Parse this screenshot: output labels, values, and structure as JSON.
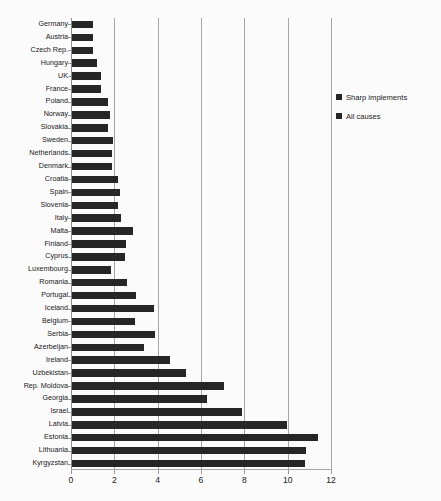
{
  "chart_data": {
    "type": "bar",
    "orientation": "horizontal",
    "title": "",
    "xlabel": "",
    "ylabel": "",
    "xlim": [
      0,
      12
    ],
    "xticks": [
      0,
      2,
      4,
      6,
      8,
      10,
      12
    ],
    "xtick_labels": [
      "0",
      "2",
      "4",
      "6",
      "8",
      "10",
      "12"
    ],
    "grid": true,
    "legend_position": "right",
    "bar_color": "#262626",
    "categories": [
      "Germany",
      "Austria",
      "Czech Rep.",
      "Hungary",
      "UK",
      "France",
      "Poland",
      "Norway",
      "Slovakia",
      "Sweden",
      "Netherlands",
      "Denmark",
      "Croatia",
      "Spain",
      "Slovenia",
      "Italy",
      "Malta",
      "Finland",
      "Cyprus",
      "Luxembourg",
      "Romania",
      "Portugal",
      "Iceland",
      "Belgium",
      "Serbia",
      "Azerbeijan",
      "Ireland",
      "Uzbekistan",
      "Rep. Moldova",
      "Georgia",
      "Israel",
      "Latvia",
      "Estonia",
      "Lithuania",
      "Kyrgyzstan"
    ],
    "series": [
      {
        "name": "All causes",
        "values": [
          0.95,
          0.95,
          0.95,
          1.15,
          1.35,
          1.35,
          1.65,
          1.75,
          1.65,
          1.9,
          1.85,
          1.85,
          2.1,
          2.2,
          2.1,
          2.25,
          2.8,
          2.5,
          2.45,
          1.8,
          2.55,
          2.95,
          3.8,
          2.9,
          3.85,
          3.3,
          4.5,
          5.25,
          7.0,
          6.25,
          7.85,
          9.9,
          11.35,
          10.8,
          10.75
        ]
      }
    ],
    "legend": [
      {
        "label": "Sharp implements",
        "color": "#262626"
      },
      {
        "label": "All causes",
        "color": "#262626"
      }
    ]
  },
  "caption": {
    "text": ""
  }
}
